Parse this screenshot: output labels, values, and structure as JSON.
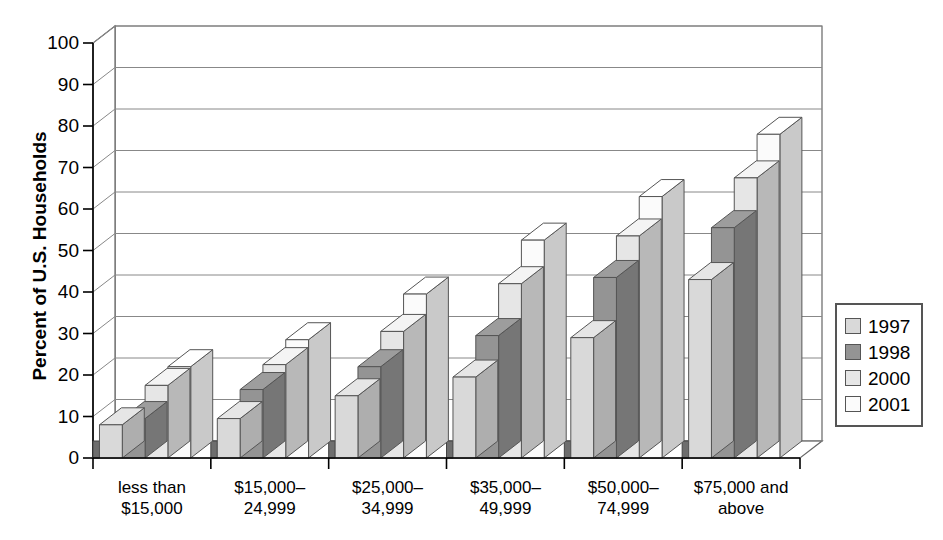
{
  "chart_data": {
    "type": "bar",
    "title": "",
    "subtitle": "",
    "xlabel": "",
    "ylabel": "Percent of U.S. Households",
    "ylim": [
      0,
      100
    ],
    "ytick_step": 10,
    "yticks": [
      0,
      10,
      20,
      30,
      40,
      50,
      60,
      70,
      80,
      90,
      100
    ],
    "grid": true,
    "style": "3d-clustered-column",
    "legend_position": "right",
    "categories": [
      "less than\n$15,000",
      "$15,000–\n24,999",
      "$25,000–\n34,999",
      "$35,000–\n49,999",
      "$50,000–\n74,999",
      "$75,000 and\nabove"
    ],
    "series": [
      {
        "name": "1997",
        "color": "#d9d9d9",
        "values": [
          8,
          9.5,
          15,
          19.5,
          29,
          43
        ]
      },
      {
        "name": "1998",
        "color": "#949494",
        "values": [
          9.5,
          16.5,
          22,
          29.5,
          43.5,
          55.5
        ]
      },
      {
        "name": "2000",
        "color": "#e6e6e6",
        "values": [
          17.5,
          22.5,
          30.5,
          42,
          53.5,
          67.5
        ]
      },
      {
        "name": "2001",
        "color": "#fbfbfb",
        "values": [
          22,
          28.5,
          39.5,
          52.5,
          63,
          78
        ]
      }
    ]
  },
  "legend": {
    "items": [
      {
        "label": "1997"
      },
      {
        "label": "1998"
      },
      {
        "label": "2000"
      },
      {
        "label": "2001"
      }
    ]
  },
  "colors": {
    "axis": "#000000",
    "gridline": "#888888",
    "plot_background": "#ffffff",
    "bar_top_light": "#f2f2f2",
    "bar_top_dark": "#6e6e6e",
    "bar_side_dark": "#5a5a5a",
    "floor": "#6e6e6e"
  }
}
